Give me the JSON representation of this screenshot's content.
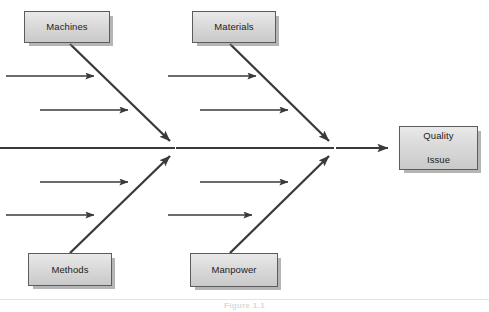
{
  "diagram": {
    "type": "fishbone-ishikawa-cause-and-effect",
    "title": "",
    "caption": "Figure 1.1",
    "effect": {
      "label_line1": "Quality",
      "label_line2": "Issue"
    },
    "categories": [
      {
        "key": "machines",
        "label": "Machines",
        "position": "top-left",
        "sub_cause_count": 5
      },
      {
        "key": "materials",
        "label": "Materials",
        "position": "top-right",
        "sub_cause_count": 5
      },
      {
        "key": "methods",
        "label": "Methods",
        "position": "bottom-left",
        "sub_cause_count": 5
      },
      {
        "key": "manpower",
        "label": "Manpower",
        "position": "bottom-right",
        "sub_cause_count": 5
      }
    ],
    "colors": {
      "line": "#404040",
      "box_border": "#5c5c5c",
      "box_fill_top": "#e9e9e9",
      "box_fill_bottom": "#c9c9c9",
      "box_shadow": "#8a8a8a",
      "text": "#1c1c1c",
      "background": "#ffffff"
    },
    "geometry": {
      "spine_y": 148,
      "spine_start_x": 0,
      "junction_left_x": 175,
      "junction_right_x": 334,
      "effect_arrow_end_x": 396,
      "sub_cause_rows_y": [
        76,
        110,
        148,
        182,
        215
      ]
    }
  }
}
